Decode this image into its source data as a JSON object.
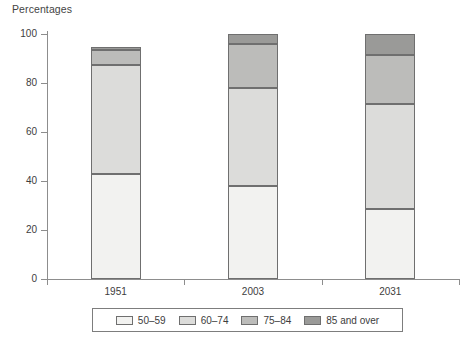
{
  "chart_data": {
    "type": "bar",
    "subtype": "stacked-percentage-column",
    "title": "Percentages",
    "xlabel": "",
    "ylabel": "",
    "ylim": [
      0,
      100
    ],
    "yticks": [
      0,
      20,
      40,
      60,
      80,
      100
    ],
    "ytick_labels": [
      "0",
      "20",
      "40",
      "60",
      "80",
      "100"
    ],
    "grid": false,
    "legend_position": "bottom",
    "categories": [
      "1951",
      "2003",
      "2031"
    ],
    "series": [
      {
        "name": "50–59",
        "color": "#f2f2f0",
        "values": [
          42.8,
          38.0,
          28.5
        ]
      },
      {
        "name": "60–74",
        "color": "#dcdcda",
        "values": [
          44.4,
          40.0,
          43.0
        ]
      },
      {
        "name": "75–84",
        "color": "#bcbcba",
        "values": [
          6.1,
          18.0,
          20.0
        ]
      },
      {
        "name": "85 and over",
        "color": "#9a9a98",
        "values": [
          1.2,
          4.0,
          8.5
        ]
      }
    ]
  },
  "chart": {
    "title": "Percentages"
  },
  "axes": {
    "y": {
      "ticks": [
        {
          "label": "100",
          "value": 100
        },
        {
          "label": "80",
          "value": 80
        },
        {
          "label": "60",
          "value": 60
        },
        {
          "label": "40",
          "value": 40
        },
        {
          "label": "20",
          "value": 20
        },
        {
          "label": "0",
          "value": 0
        }
      ]
    },
    "x": {
      "categories": [
        {
          "label": "1951"
        },
        {
          "label": "2003"
        },
        {
          "label": "2031"
        }
      ]
    }
  },
  "legend": {
    "items": [
      {
        "label": "50–59",
        "color": "#f2f2f0"
      },
      {
        "label": "60–74",
        "color": "#dcdcda"
      },
      {
        "label": "75–84",
        "color": "#bcbcba"
      },
      {
        "label": "85 and over",
        "color": "#9a9a98"
      }
    ]
  }
}
